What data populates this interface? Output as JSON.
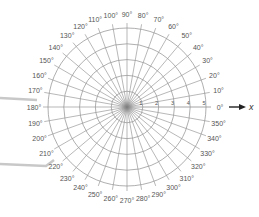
{
  "diagram": {
    "type": "polar-grid",
    "center": [
      127,
      107
    ],
    "ring_radius_px": 15.8,
    "ring_count": 5,
    "ray_length_px": 84,
    "ray_step_deg": 10,
    "radial_labels": [
      "1",
      "2",
      "3",
      "4",
      "5"
    ],
    "angle_labels": [
      {
        "deg": 0,
        "text": "0°"
      },
      {
        "deg": 10,
        "text": "10°"
      },
      {
        "deg": 20,
        "text": "20°"
      },
      {
        "deg": 30,
        "text": "30°"
      },
      {
        "deg": 40,
        "text": "40°"
      },
      {
        "deg": 50,
        "text": "50°"
      },
      {
        "deg": 60,
        "text": "60°"
      },
      {
        "deg": 70,
        "text": "70°"
      },
      {
        "deg": 80,
        "text": "80°"
      },
      {
        "deg": 90,
        "text": "90°"
      },
      {
        "deg": 100,
        "text": "100°"
      },
      {
        "deg": 110,
        "text": "110°"
      },
      {
        "deg": 120,
        "text": "120°"
      },
      {
        "deg": 130,
        "text": "130°"
      },
      {
        "deg": 140,
        "text": "140°"
      },
      {
        "deg": 150,
        "text": "150°"
      },
      {
        "deg": 160,
        "text": "160°"
      },
      {
        "deg": 170,
        "text": "170°"
      },
      {
        "deg": 180,
        "text": "180°"
      },
      {
        "deg": 190,
        "text": "190°"
      },
      {
        "deg": 200,
        "text": "200°"
      },
      {
        "deg": 210,
        "text": "210°"
      },
      {
        "deg": 220,
        "text": "220°"
      },
      {
        "deg": 230,
        "text": "230°"
      },
      {
        "deg": 240,
        "text": "240°"
      },
      {
        "deg": 250,
        "text": "250°"
      },
      {
        "deg": 260,
        "text": "260°"
      },
      {
        "deg": 270,
        "text": "270°"
      },
      {
        "deg": 280,
        "text": "280°"
      },
      {
        "deg": 290,
        "text": "290°"
      },
      {
        "deg": 300,
        "text": "300°"
      },
      {
        "deg": 310,
        "text": "310°"
      },
      {
        "deg": 320,
        "text": "320°"
      },
      {
        "deg": 330,
        "text": "330°"
      },
      {
        "deg": 340,
        "text": "340°"
      },
      {
        "deg": 350,
        "text": "350°"
      }
    ],
    "axis_label": "x",
    "colors": {
      "grid": "#9a9a9a",
      "label": "#555555",
      "axis": "#222222",
      "center": "#8a8a8a",
      "pointer": "#c8c8c8"
    }
  }
}
